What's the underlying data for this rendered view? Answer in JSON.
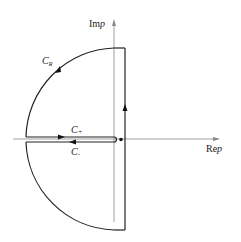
{
  "diagram": {
    "axes": {
      "imag_label_prefix": "Im",
      "imag_label_var": "p",
      "real_label_prefix": "Re",
      "real_label_var": "p"
    },
    "contours": {
      "arc": {
        "label_main": "C",
        "label_sub": "R"
      },
      "upper_cut": {
        "label_main": "C",
        "label_sub": "+"
      },
      "lower_cut": {
        "label_main": "C",
        "label_sub": "-"
      }
    },
    "branch_point": "dot on real axis just right of origin",
    "colors": {
      "line": "#222222",
      "axis": "#777777",
      "background": "#ffffff"
    }
  }
}
